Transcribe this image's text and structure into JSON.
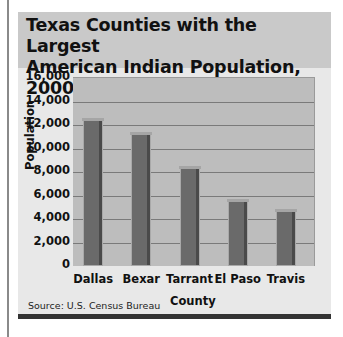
{
  "title": "Texas Counties with the Largest American Indian Population, 2000",
  "title_lines": [
    "Texas Counties with the Largest",
    "American Indian Population, 2000"
  ],
  "source": "Source: U.S. Census Bureau",
  "y_ticks": [
    "16,000",
    "14,000",
    "12,000",
    "10,000",
    "8,000",
    "6,000",
    "4,000",
    "2,000",
    "0"
  ],
  "chart_data": {
    "type": "bar",
    "title": "Texas Counties with the Largest American Indian Population, 2000",
    "xlabel": "County",
    "ylabel": "Population",
    "categories": [
      "Dallas",
      "Bexar",
      "Tarrant",
      "El Paso",
      "Travis"
    ],
    "values": [
      12400,
      11200,
      8300,
      5500,
      4650
    ],
    "ylim": [
      0,
      16000
    ],
    "y_tick_step": 2000,
    "grid": true,
    "legend": null,
    "source": "Source: U.S. Census Bureau"
  },
  "colors": {
    "bar": "#6a6a6a",
    "plot_bg": "#bdbdbd",
    "title_bg": "#c9c9c9",
    "panel_bg": "#e8e8e8"
  }
}
